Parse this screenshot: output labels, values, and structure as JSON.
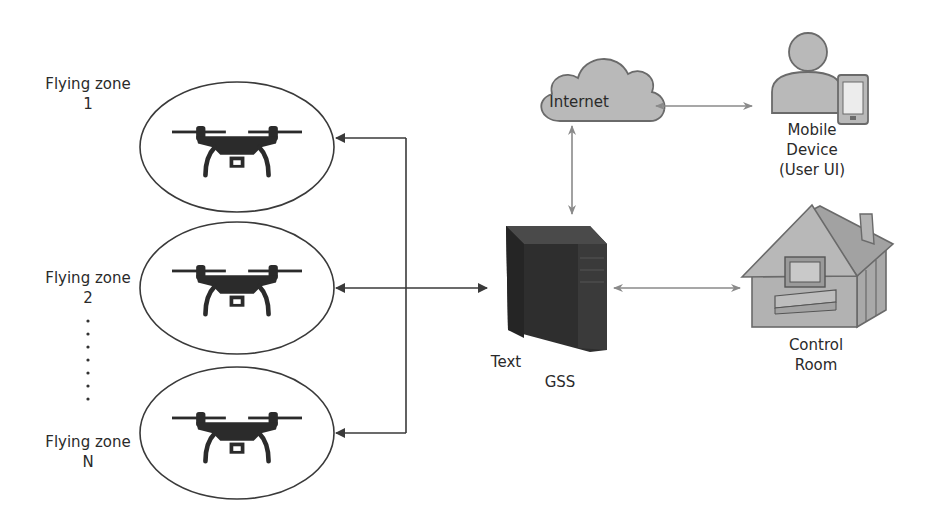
{
  "diagram": {
    "zones": [
      {
        "id": "zone-1",
        "name": "Flying zone",
        "index": "1"
      },
      {
        "id": "zone-2",
        "name": "Flying zone",
        "index": "2"
      },
      {
        "id": "zone-n",
        "name": "Flying zone",
        "index": "N"
      }
    ],
    "ellipsis": "⋮",
    "gss": {
      "label": "GSS",
      "extra_label": "Text"
    },
    "internet": {
      "label": "Internet"
    },
    "mobile": {
      "line1": "Mobile",
      "line2": "Device",
      "line3": "(User UI)"
    },
    "control_room": {
      "line1": "Control",
      "line2": "Room"
    },
    "connections": [
      {
        "from": "GSS",
        "to": "Flying zone 1",
        "type": "arrow"
      },
      {
        "from": "GSS",
        "to": "Flying zone 2",
        "type": "bidirectional"
      },
      {
        "from": "GSS",
        "to": "Flying zone N",
        "type": "arrow"
      },
      {
        "from": "Internet",
        "to": "GSS",
        "type": "bidirectional"
      },
      {
        "from": "Internet",
        "to": "Mobile Device (User UI)",
        "type": "bidirectional"
      },
      {
        "from": "GSS",
        "to": "Control Room",
        "type": "bidirectional"
      }
    ],
    "colors": {
      "line_dark": "#3a3a3a",
      "line_gray": "#8a8a8a",
      "icon_gray": "#b5b5b5",
      "icon_outline": "#6a6a6a",
      "drone": "#2b2b2b",
      "server": "#2e2e2e"
    }
  }
}
